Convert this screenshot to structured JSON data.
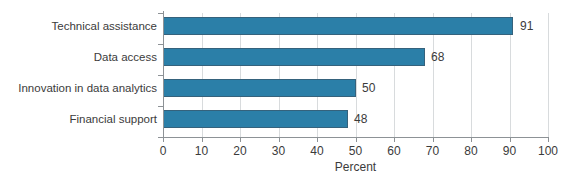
{
  "chart_data": {
    "type": "bar",
    "orientation": "horizontal",
    "title": "",
    "xlabel": "Percent",
    "ylabel": "",
    "categories": [
      "Technical assistance",
      "Data access",
      "Innovation in data analytics",
      "Financial support"
    ],
    "values": [
      91,
      68,
      50,
      48
    ],
    "value_labels": [
      "91",
      "68",
      "50",
      "48"
    ],
    "xlim": [
      0,
      100
    ],
    "xticks": [
      0,
      10,
      20,
      30,
      40,
      50,
      60,
      70,
      80,
      90,
      100
    ],
    "xtick_labels": [
      "0",
      "10",
      "20",
      "30",
      "40",
      "50",
      "60",
      "70",
      "80",
      "90",
      "100"
    ],
    "grid": "vertical",
    "legend": null,
    "colors": {
      "bar_fill": "#2b7fa8",
      "bar_edge": "#35627c",
      "axis_line": "#8d9296",
      "gridline": "#d8dbdd",
      "text": "#3b3b3b",
      "background": "#ffffff"
    }
  }
}
